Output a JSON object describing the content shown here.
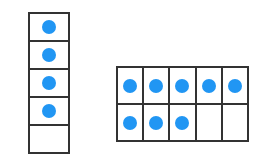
{
  "colors": {
    "dot": "#2196F3",
    "border": "#333333"
  },
  "frames": [
    {
      "name": "five-frame",
      "rows": 5,
      "cols": 1,
      "filled": 4,
      "total": 5
    },
    {
      "name": "ten-frame",
      "rows": 2,
      "cols": 5,
      "filled": 8,
      "total": 10,
      "filled_cells": [
        [
          0,
          0
        ],
        [
          0,
          1
        ],
        [
          0,
          2
        ],
        [
          0,
          3
        ],
        [
          0,
          4
        ],
        [
          1,
          0
        ],
        [
          1,
          1
        ],
        [
          1,
          2
        ]
      ]
    }
  ]
}
